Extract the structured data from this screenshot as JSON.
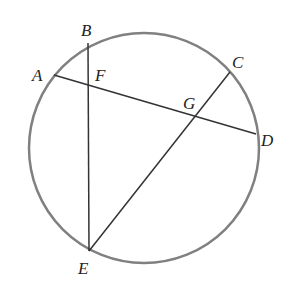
{
  "diagram": {
    "circle": {
      "cx": 144,
      "cy": 148,
      "r": 115,
      "stroke": "#808080"
    },
    "line_color": "#333333",
    "points": {
      "A": {
        "label": "A",
        "x": 54,
        "y": 75
      },
      "B": {
        "label": "B",
        "x": 88,
        "y": 43
      },
      "C": {
        "label": "C",
        "x": 230,
        "y": 72
      },
      "D": {
        "label": "D",
        "x": 256,
        "y": 134
      },
      "E": {
        "label": "E",
        "x": 89,
        "y": 251
      },
      "F": {
        "label": "F",
        "x": 88,
        "y": 85
      },
      "G": {
        "label": "G",
        "x": 195,
        "y": 121
      }
    },
    "segments": [
      {
        "from": "A",
        "to": "D"
      },
      {
        "from": "B",
        "to": "E"
      },
      {
        "from": "C",
        "to": "E"
      }
    ]
  }
}
